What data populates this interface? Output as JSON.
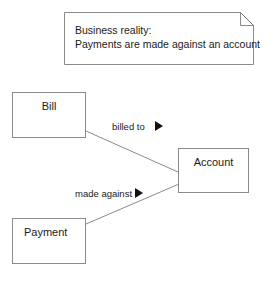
{
  "diagram": {
    "note": {
      "line1": "Business reality:",
      "line2": "Payments are made against an account"
    },
    "classes": [
      {
        "id": "bill",
        "label": "Bill"
      },
      {
        "id": "account",
        "label": "Account"
      },
      {
        "id": "payment",
        "label": "Payment"
      }
    ],
    "associations": [
      {
        "id": "billed-to",
        "label": "billed to",
        "from": "Bill",
        "to": "Account",
        "marker": "solid-right-triangle"
      },
      {
        "id": "made-against",
        "label": "made against",
        "from": "Payment",
        "to": "Account",
        "marker": "solid-right-triangle"
      }
    ],
    "colors": {
      "stroke": "#8a8a8a",
      "text": "#1a1a1a",
      "marker": "#111111",
      "background": "#ffffff"
    }
  }
}
